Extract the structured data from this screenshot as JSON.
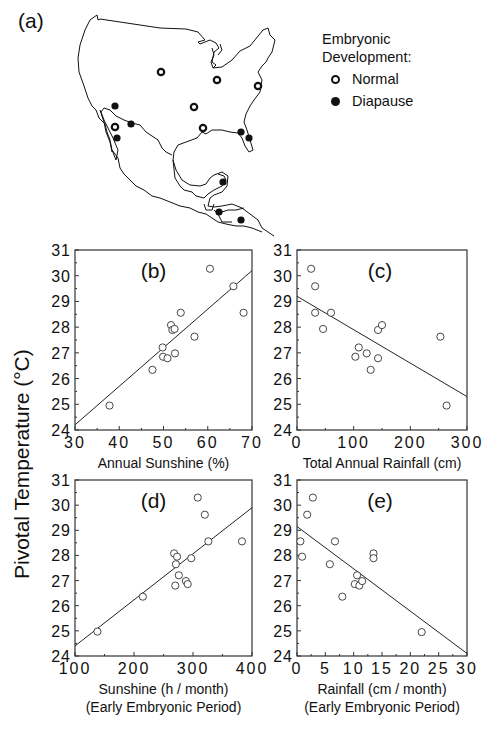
{
  "figure": {
    "panel_a_label": "(a)",
    "legend": {
      "title_line1": "Embryonic",
      "title_line2": "Development:",
      "items": [
        {
          "label": "Normal",
          "marker": "open-circle"
        },
        {
          "label": "Diapause",
          "marker": "filled-circle"
        }
      ]
    },
    "shared_ylabel": "Pivotal  Temperature (°C)",
    "map_markers": [
      {
        "type": "normal",
        "x": 161,
        "y": 72
      },
      {
        "type": "normal",
        "x": 217,
        "y": 80
      },
      {
        "type": "normal",
        "x": 258,
        "y": 86
      },
      {
        "type": "normal",
        "x": 194,
        "y": 107
      },
      {
        "type": "normal",
        "x": 203,
        "y": 128
      },
      {
        "type": "normal",
        "x": 115,
        "y": 127
      },
      {
        "type": "diapause",
        "x": 115,
        "y": 106
      },
      {
        "type": "diapause",
        "x": 131,
        "y": 124
      },
      {
        "type": "diapause",
        "x": 117,
        "y": 138
      },
      {
        "type": "diapause",
        "x": 241,
        "y": 132
      },
      {
        "type": "diapause",
        "x": 249,
        "y": 138
      },
      {
        "type": "diapause",
        "x": 223,
        "y": 182
      },
      {
        "type": "diapause",
        "x": 219,
        "y": 212
      },
      {
        "type": "diapause",
        "x": 241,
        "y": 220
      }
    ]
  },
  "chart_data": [
    {
      "panel": "(b)",
      "type": "scatter",
      "xlabel": "Annual Sunshine (%)",
      "xlabel2": "",
      "ylabel": "Pivotal Temperature (°C)",
      "xlim": [
        30,
        70
      ],
      "ylim": [
        24,
        31
      ],
      "xticks": [
        30,
        40,
        50,
        60,
        70
      ],
      "yticks": [
        24,
        25,
        26,
        27,
        28,
        29,
        30,
        31
      ],
      "points": [
        [
          37.8,
          24.95
        ],
        [
          47.5,
          26.34
        ],
        [
          49.8,
          27.21
        ],
        [
          49.9,
          26.85
        ],
        [
          50.9,
          26.79
        ],
        [
          51.7,
          28.08
        ],
        [
          52.0,
          27.89
        ],
        [
          52.5,
          27.93
        ],
        [
          52.6,
          26.98
        ],
        [
          53.9,
          28.56
        ],
        [
          57.0,
          27.63
        ],
        [
          60.5,
          30.27
        ],
        [
          65.8,
          29.59
        ],
        [
          68.1,
          28.56
        ]
      ],
      "regression_line": [
        [
          30,
          24.2
        ],
        [
          70,
          30.2
        ]
      ],
      "grid": false
    },
    {
      "panel": "(c)",
      "type": "scatter",
      "xlabel": "Total Annual Rainfall (cm)",
      "xlabel2": "",
      "ylabel": "Pivotal Temperature (°C)",
      "xlim": [
        0,
        300
      ],
      "ylim": [
        24,
        31
      ],
      "xticks": [
        0,
        100,
        200,
        300
      ],
      "yticks": [
        24,
        25,
        26,
        27,
        28,
        29,
        30,
        31
      ],
      "points": [
        [
          25,
          30.27
        ],
        [
          32,
          29.59
        ],
        [
          32,
          28.56
        ],
        [
          46,
          27.93
        ],
        [
          60,
          28.56
        ],
        [
          103,
          26.85
        ],
        [
          109,
          27.21
        ],
        [
          123,
          26.98
        ],
        [
          130,
          26.34
        ],
        [
          143,
          26.79
        ],
        [
          143,
          27.89
        ],
        [
          150,
          28.08
        ],
        [
          253,
          27.63
        ],
        [
          264,
          24.95
        ]
      ],
      "regression_line": [
        [
          0,
          29.2
        ],
        [
          300,
          25.3
        ]
      ],
      "grid": false
    },
    {
      "panel": "(d)",
      "type": "scatter",
      "xlabel": "Sunshine  (h  /  month)",
      "xlabel2": "(Early Embryonic Period)",
      "ylabel": "Pivotal Temperature (°C)",
      "xlim": [
        100,
        400
      ],
      "ylim": [
        24,
        31
      ],
      "xticks": [
        100,
        200,
        300,
        400
      ],
      "yticks": [
        24,
        25,
        26,
        27,
        28,
        29,
        30,
        31
      ],
      "points": [
        [
          138,
          24.97
        ],
        [
          215,
          26.36
        ],
        [
          268,
          28.08
        ],
        [
          270,
          26.8
        ],
        [
          271,
          27.65
        ],
        [
          273,
          27.95
        ],
        [
          276,
          27.21
        ],
        [
          288,
          26.98
        ],
        [
          291,
          26.86
        ],
        [
          297,
          27.89
        ],
        [
          308,
          30.3
        ],
        [
          320,
          29.62
        ],
        [
          326,
          28.56
        ],
        [
          383,
          28.56
        ]
      ],
      "regression_line": [
        [
          100,
          24.4
        ],
        [
          400,
          29.9
        ]
      ],
      "grid": false
    },
    {
      "panel": "(e)",
      "type": "scatter",
      "xlabel": "Rainfall (cm / month)",
      "xlabel2": "(Early Embryonic Period)",
      "ylabel": "Pivotal Temperature (°C)",
      "xlim": [
        0,
        30
      ],
      "ylim": [
        24,
        31
      ],
      "xticks": [
        0,
        5,
        10,
        15,
        20,
        25,
        30
      ],
      "yticks": [
        24,
        25,
        26,
        27,
        28,
        29,
        30,
        31
      ],
      "points": [
        [
          0.6,
          28.56
        ],
        [
          0.9,
          27.95
        ],
        [
          1.8,
          29.62
        ],
        [
          2.8,
          30.3
        ],
        [
          5.8,
          27.65
        ],
        [
          6.7,
          28.56
        ],
        [
          8.0,
          26.36
        ],
        [
          10.2,
          26.86
        ],
        [
          10.6,
          27.21
        ],
        [
          11.0,
          26.8
        ],
        [
          11.5,
          26.98
        ],
        [
          13.5,
          28.08
        ],
        [
          13.5,
          27.89
        ],
        [
          22.0,
          24.95
        ]
      ],
      "regression_line": [
        [
          0,
          29.15
        ],
        [
          30,
          24.1
        ]
      ],
      "grid": false
    }
  ]
}
